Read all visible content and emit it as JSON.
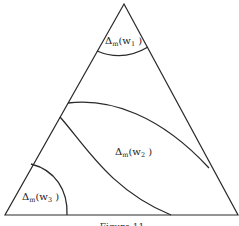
{
  "diagram": {
    "type": "ternary-region-diagram",
    "triangle": {
      "vertices": [
        [
          124,
          4
        ],
        [
          5,
          215
        ],
        [
          238,
          215
        ]
      ]
    },
    "regions": [
      {
        "id": "w1",
        "label_prefix": "Δ",
        "label_sub": "m",
        "label_arg": "(w",
        "label_arg_sub": "1",
        "label_close": " )",
        "position": "top corner"
      },
      {
        "id": "w2",
        "label_prefix": "Δ",
        "label_sub": "m",
        "label_arg": "(w",
        "label_arg_sub": "2",
        "label_close": " )",
        "position": "middle band"
      },
      {
        "id": "w3",
        "label_prefix": "Δ",
        "label_sub": "m",
        "label_arg": "(w",
        "label_arg_sub": "3",
        "label_close": " )",
        "position": "bottom-left corner"
      }
    ],
    "caption": "Figure 11"
  }
}
